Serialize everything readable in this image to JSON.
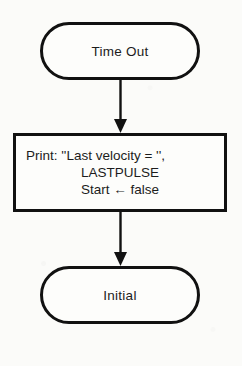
{
  "diagram": {
    "orientation": "vertical",
    "stroke_color": "#111111",
    "background_color": "#fbfbf9",
    "nodes": [
      {
        "id": "time-out",
        "shape": "terminator",
        "label": "Time Out"
      },
      {
        "id": "process",
        "shape": "process",
        "lines": [
          "Print: ''Last velocity = '',",
          "LASTPULSE",
          "Start ← false"
        ]
      },
      {
        "id": "initial",
        "shape": "terminator",
        "label": "Initial"
      }
    ],
    "connectors": [
      {
        "id": "time-out-to-process",
        "from": "time-out",
        "to": "process",
        "arrowhead": "solid-triangle"
      },
      {
        "id": "process-to-initial",
        "from": "process",
        "to": "initial",
        "arrowhead": "solid-triangle"
      }
    ]
  }
}
